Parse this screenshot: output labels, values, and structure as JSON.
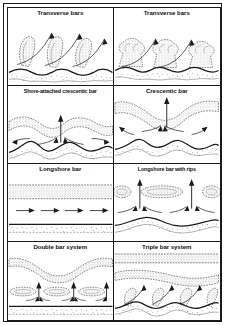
{
  "figure": {
    "kind": "scientific-diagram",
    "rows": 4,
    "columns": 2,
    "colors": {
      "line": "#1a1a1a",
      "background": "#ffffff",
      "stipple": "#555555",
      "border": "#1a1a1a"
    }
  },
  "panels": [
    {
      "id": "transverse-bars-a",
      "title": "Transverse bars",
      "row": 1,
      "column": 1,
      "features": [
        "stippled oblique bars",
        "sinuous shoreline",
        "curved flow arrows",
        "stippled beach"
      ]
    },
    {
      "id": "transverse-bars-b",
      "title": "Transverse bars",
      "row": 1,
      "column": 2,
      "features": [
        "stippled mushroom bars",
        "sinuous shoreline",
        "curved flow arrows",
        "stippled beach"
      ]
    },
    {
      "id": "shore-attached-crescentic-bar",
      "title": "Shore-attached crescentic bar",
      "row": 2,
      "column": 1,
      "features": [
        "crescentic stippled bar",
        "central rip arrow",
        "converging feeder arrows",
        "sinuous shoreline"
      ]
    },
    {
      "id": "crescentic-bar",
      "title": "Crescentic bar",
      "row": 2,
      "column": 2,
      "features": [
        "detached crescentic stippled bar",
        "central rip arrow",
        "feeder arrows",
        "sinuous shoreline"
      ]
    },
    {
      "id": "longshore-bar",
      "title": "Longshore bar",
      "row": 3,
      "column": 1,
      "features": [
        "straight stippled longshore bar",
        "four straight longshore arrows",
        "straight shoreline"
      ]
    },
    {
      "id": "longshore-bar-with-rips",
      "title": "Longshore bar with rips",
      "row": 3,
      "column": 2,
      "features": [
        "segmented stippled bars",
        "two vertical rip arrows",
        "curved feeder arrows",
        "sinuous shoreline"
      ]
    },
    {
      "id": "double-bar-system",
      "title": "Double bar system",
      "row": 4,
      "column": 1,
      "features": [
        "outer crescentic stippled bar",
        "inner segmented bars",
        "three rip arrows",
        "straight shoreline"
      ]
    },
    {
      "id": "triple-bar-system",
      "title": "Triple bar system",
      "row": 4,
      "column": 2,
      "features": [
        "outer straight stippled bar",
        "middle crescentic bar",
        "inner transverse bars",
        "oblique arrows",
        "sinuous shoreline"
      ]
    }
  ]
}
